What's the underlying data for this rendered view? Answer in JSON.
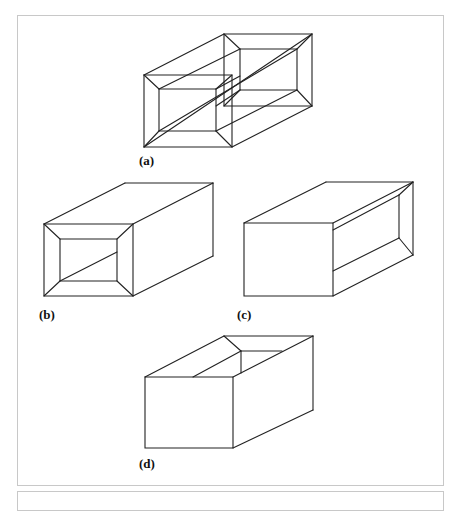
{
  "figure": {
    "panels": [
      {
        "id": "a",
        "label": "(a)",
        "description": "Hollow rectangular tube shown as wireframe with inner and outer edges visible at both ends"
      },
      {
        "id": "b",
        "label": "(b)",
        "description": "Rectangular tube with open front end showing inner opening and one inner diagonal edge"
      },
      {
        "id": "c",
        "label": "(c)",
        "description": "Rectangular tube viewed with solid front face, open end visible on right side face"
      },
      {
        "id": "d",
        "label": "(d)",
        "description": "Rectangular open-top box / channel with inner wall visible from above"
      }
    ]
  },
  "style": {
    "line_color": "#222222",
    "frame_color": "#c8c8c8",
    "background": "#ffffff"
  }
}
